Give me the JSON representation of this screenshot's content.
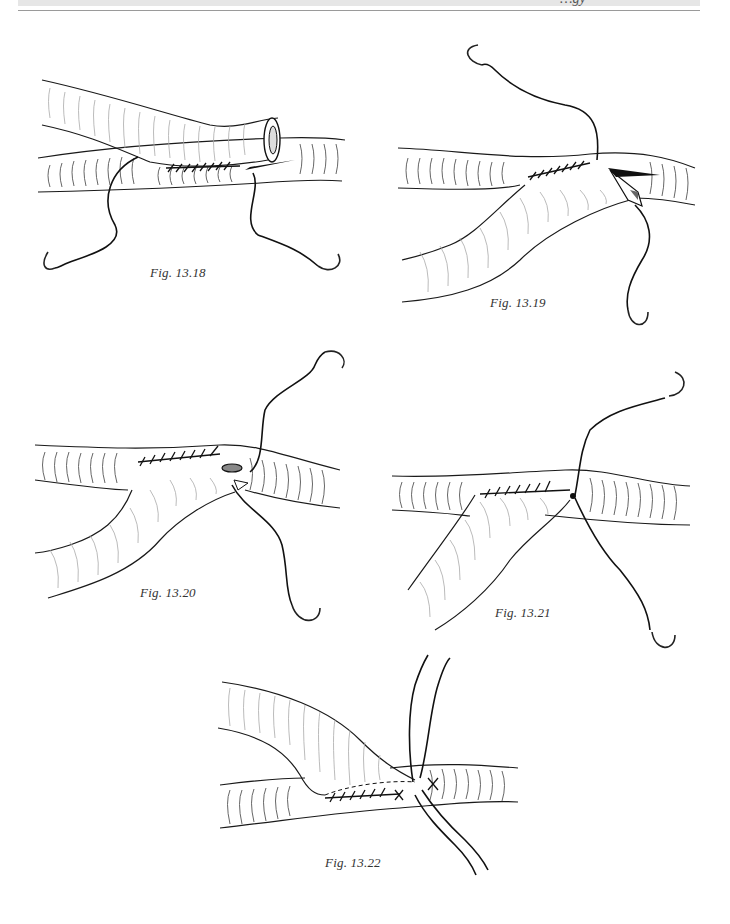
{
  "page": {
    "running_header": {
      "text": "…gy",
      "truncated": true,
      "band_color": "#e6e6e6",
      "rule_color": "#9a9a9a"
    }
  },
  "figures": [
    {
      "id": "fig-13-18",
      "caption": "Fig. 13.18",
      "depicts": "end-to-side anastomosis, posterior wall running suture begun, heel and toe needles"
    },
    {
      "id": "fig-13-19",
      "caption": "Fig. 13.19",
      "depicts": "graft flipped, suture continued along one side toward toe"
    },
    {
      "id": "fig-13-20",
      "caption": "Fig. 13.20",
      "depicts": "suture line nearing toe of arteriotomy"
    },
    {
      "id": "fig-13-21",
      "caption": "Fig. 13.21",
      "depicts": "suture line around toe, two needles"
    },
    {
      "id": "fig-13-22",
      "caption": "Fig. 13.22",
      "depicts": "completed anastomosis with sutures tied"
    }
  ],
  "colors": {
    "ink": "#111111",
    "hatching": "#555555",
    "light_hatching": "#aaaaaa",
    "background": "#ffffff"
  }
}
